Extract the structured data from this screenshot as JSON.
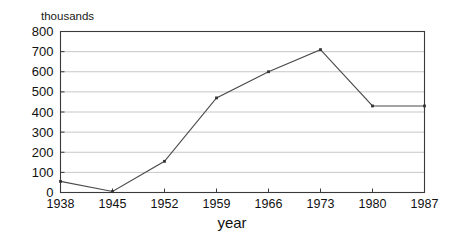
{
  "chart_data": {
    "type": "line",
    "title": "",
    "subtitle": "",
    "xlabel": "year",
    "ylabel": "thousands",
    "ylabel_position": "above-axis",
    "x": [
      1938,
      1945,
      1952,
      1959,
      1966,
      1973,
      1980,
      1987
    ],
    "categories": [
      "1938",
      "1945",
      "1952",
      "1959",
      "1966",
      "1973",
      "1980",
      "1987"
    ],
    "values": [
      55,
      5,
      155,
      470,
      600,
      710,
      430,
      430
    ],
    "series": [
      {
        "name": "",
        "values": [
          55,
          5,
          155,
          470,
          600,
          710,
          430,
          430
        ]
      }
    ],
    "xlim": [
      1938,
      1987
    ],
    "ylim": [
      0,
      800
    ],
    "ytick_labels": [
      "800",
      "700",
      "600",
      "500",
      "400",
      "300",
      "200",
      "100",
      "0"
    ],
    "ytick_values": [
      800,
      700,
      600,
      500,
      400,
      300,
      200,
      100,
      0
    ],
    "xtick_labels": [
      "1938",
      "1945",
      "1952",
      "1959",
      "1966",
      "1973",
      "1980",
      "1987"
    ],
    "grid": "horizontal",
    "legend": "none",
    "line_color": "#4a4a4a",
    "marker_color": "#333333",
    "grid_color": "#b9b9b9",
    "frame_color": "#3a3a3a",
    "background_color": "#ffffff",
    "annotations": []
  },
  "axes": {
    "y_axis_label": "thousands",
    "x_axis_title": "year"
  }
}
